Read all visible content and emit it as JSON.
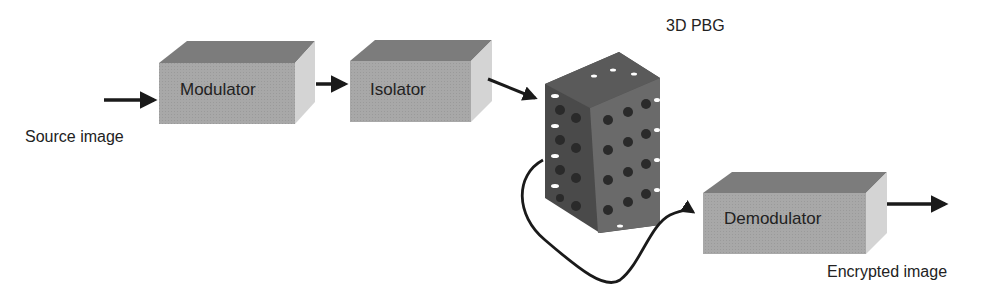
{
  "diagram": {
    "title": "",
    "blocks": {
      "modulator": {
        "label": "Modulator"
      },
      "isolator": {
        "label": "Isolator"
      },
      "pbg": {
        "label": "3D PBG"
      },
      "demodulator": {
        "label": "Demodulator"
      }
    },
    "io": {
      "input_label": "Source image",
      "output_label": "Encrypted image"
    },
    "flow": [
      "Source image",
      "Modulator",
      "Isolator",
      "3D PBG",
      "Demodulator",
      "Encrypted image"
    ],
    "colors": {
      "box_front": "#a9a9a9",
      "box_top": "#7c7c7c",
      "box_side": "#d2d2d2",
      "arrow": "#1a1a1a",
      "lattice_dark": "#3a3a3a",
      "lattice_mid": "#6e6e6e"
    }
  }
}
